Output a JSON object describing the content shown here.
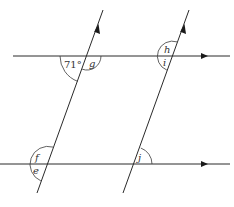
{
  "diagram": {
    "given_angle": "71°",
    "angle_labels": {
      "g": "g",
      "h": "h",
      "i": "i",
      "f": "f",
      "e": "e",
      "j": "j"
    },
    "colors": {
      "line": "#2a2a2a",
      "background": "#ffffff"
    }
  }
}
